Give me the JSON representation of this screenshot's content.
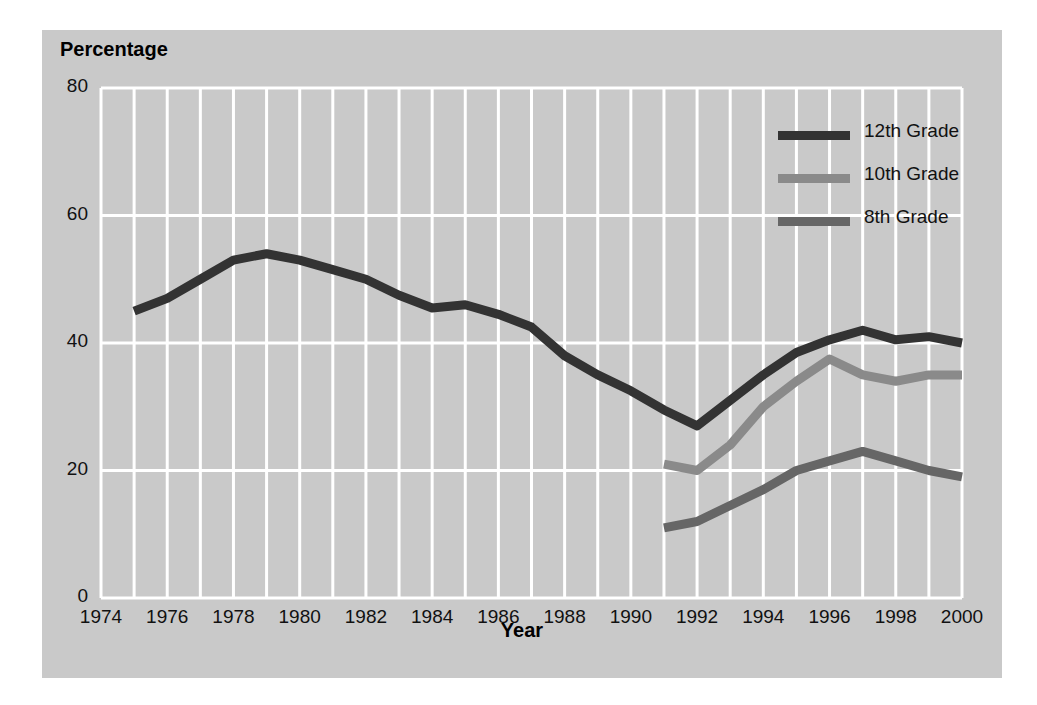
{
  "figure": {
    "panel_color": "#c9c9c9",
    "page_color": "#ffffff",
    "grid_color": "#ffffff"
  },
  "chart_data": {
    "type": "line",
    "title": "",
    "xlabel": "Year",
    "ylabel": "Percentage",
    "xlim": [
      1974,
      2000
    ],
    "ylim": [
      0,
      80
    ],
    "grid": true,
    "legend_position": "top-right",
    "x_ticks": [
      1974,
      1976,
      1978,
      1980,
      1982,
      1984,
      1986,
      1988,
      1990,
      1992,
      1994,
      1996,
      1998,
      2000
    ],
    "y_ticks": [
      0,
      20,
      40,
      60,
      80
    ],
    "series": [
      {
        "name": "12th Grade",
        "color": "#333333",
        "x": [
          1975,
          1976,
          1977,
          1978,
          1979,
          1980,
          1981,
          1982,
          1983,
          1984,
          1985,
          1986,
          1987,
          1988,
          1989,
          1990,
          1991,
          1992,
          1993,
          1994,
          1995,
          1996,
          1997,
          1998,
          1999,
          2000
        ],
        "values": [
          45,
          47,
          50,
          53,
          54,
          53,
          51.5,
          50,
          47.5,
          45.5,
          46,
          44.5,
          42.5,
          38,
          35,
          32.5,
          29.5,
          27,
          31,
          35,
          38.5,
          40.5,
          42,
          40.5,
          41,
          40
        ]
      },
      {
        "name": "10th Grade",
        "color": "#8a8a8a",
        "x": [
          1991,
          1992,
          1993,
          1994,
          1995,
          1996,
          1997,
          1998,
          1999,
          2000
        ],
        "values": [
          21,
          20,
          24,
          30,
          34,
          37.5,
          35,
          34,
          35,
          35
        ]
      },
      {
        "name": "8th Grade",
        "color": "#666666",
        "x": [
          1991,
          1992,
          1993,
          1994,
          1995,
          1996,
          1997,
          1998,
          1999,
          2000
        ],
        "values": [
          11,
          12,
          14.5,
          17,
          20,
          21.5,
          23,
          21.5,
          20,
          19
        ]
      }
    ]
  }
}
